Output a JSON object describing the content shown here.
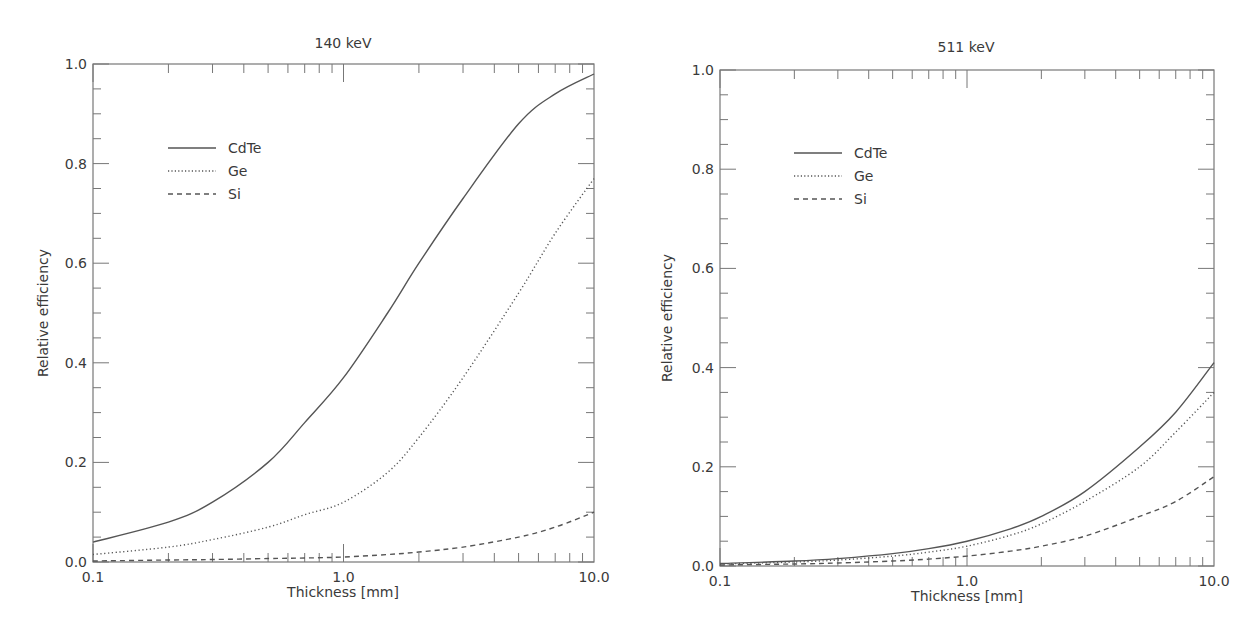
{
  "chart_data": [
    {
      "type": "line",
      "title": "140 keV",
      "xlabel": "Thickness [mm]",
      "ylabel": "Relative efficiency",
      "xscale": "log",
      "xlim": [
        0.1,
        10.0
      ],
      "ylim": [
        0.0,
        1.0
      ],
      "xticks": [
        "0.1",
        "1.0",
        "10.0"
      ],
      "yticks": [
        "0.0",
        "0.2",
        "0.4",
        "0.6",
        "0.8",
        "1.0"
      ],
      "grid": false,
      "legend_position": "upper left",
      "x": [
        0.1,
        0.2,
        0.3,
        0.5,
        0.7,
        1.0,
        1.5,
        2.0,
        3.0,
        5.0,
        7.0,
        10.0
      ],
      "series": [
        {
          "name": "CdTe",
          "style": "solid",
          "values": [
            0.04,
            0.08,
            0.12,
            0.2,
            0.28,
            0.37,
            0.5,
            0.6,
            0.73,
            0.88,
            0.94,
            0.98
          ]
        },
        {
          "name": "Ge",
          "style": "dotted",
          "values": [
            0.015,
            0.03,
            0.045,
            0.07,
            0.095,
            0.12,
            0.18,
            0.25,
            0.37,
            0.54,
            0.66,
            0.77
          ]
        },
        {
          "name": "Si",
          "style": "dashed",
          "values": [
            0.002,
            0.004,
            0.005,
            0.007,
            0.008,
            0.01,
            0.015,
            0.02,
            0.03,
            0.05,
            0.07,
            0.1
          ]
        }
      ]
    },
    {
      "type": "line",
      "title": "511 keV",
      "xlabel": "Thickness [mm]",
      "ylabel": "Relative efficiency",
      "xscale": "log",
      "xlim": [
        0.1,
        10.0
      ],
      "ylim": [
        0.0,
        1.0
      ],
      "xticks": [
        "0.1",
        "1.0",
        "10.0"
      ],
      "yticks": [
        "0.0",
        "0.2",
        "0.4",
        "0.6",
        "0.8",
        "1.0"
      ],
      "grid": false,
      "legend_position": "upper left",
      "x": [
        0.1,
        0.2,
        0.3,
        0.5,
        0.7,
        1.0,
        1.5,
        2.0,
        3.0,
        5.0,
        7.0,
        10.0
      ],
      "series": [
        {
          "name": "CdTe",
          "style": "solid",
          "values": [
            0.005,
            0.01,
            0.015,
            0.025,
            0.035,
            0.05,
            0.075,
            0.1,
            0.15,
            0.24,
            0.31,
            0.41
          ]
        },
        {
          "name": "Ge",
          "style": "dotted",
          "values": [
            0.004,
            0.008,
            0.012,
            0.02,
            0.028,
            0.04,
            0.062,
            0.085,
            0.13,
            0.2,
            0.27,
            0.35
          ]
        },
        {
          "name": "Si",
          "style": "dashed",
          "values": [
            0.002,
            0.004,
            0.006,
            0.01,
            0.014,
            0.02,
            0.03,
            0.04,
            0.06,
            0.1,
            0.13,
            0.18
          ]
        }
      ]
    }
  ],
  "panels": [
    {
      "title": "140 keV",
      "xlabel": "Thickness [mm]",
      "ylabel": "Relative efficiency",
      "legend": [
        "CdTe",
        "Ge",
        "Si"
      ]
    },
    {
      "title": "511 keV",
      "xlabel": "Thickness [mm]",
      "ylabel": "Relative efficiency",
      "legend": [
        "CdTe",
        "Ge",
        "Si"
      ]
    }
  ],
  "colors": {
    "line": "#555555",
    "axis": "#777777",
    "text": "#3a3a3a"
  }
}
